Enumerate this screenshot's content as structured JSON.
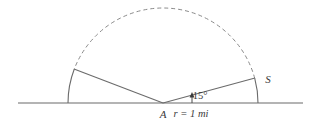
{
  "figure": {
    "type": "geometry-diagram",
    "background_color": "#ffffff",
    "stroke_color": "#6b6b6b",
    "label_color": "#3a3a3a",
    "baseline": {
      "name": "ground-line",
      "x_start": 18,
      "x_end": 303,
      "y": 103
    },
    "center": {
      "label": "A",
      "x": 163,
      "y": 103
    },
    "circle": {
      "radius_px": 95,
      "radius_label": "r = 1 mi",
      "radius_value": 1,
      "radius_unit": "mi"
    },
    "arcs": [
      {
        "name": "dashed-upper-arc",
        "style": "dashed",
        "start_angle_deg": 15,
        "end_angle_deg": 159
      },
      {
        "name": "solid-left-arc",
        "style": "solid",
        "start_angle_deg": 159,
        "end_angle_deg": 180
      },
      {
        "name": "solid-right-arc",
        "style": "solid",
        "start_angle_deg": 0,
        "end_angle_deg": 15
      }
    ],
    "rays": [
      {
        "name": "left-ray",
        "from_x": 163,
        "from_y": 103,
        "to_x": 74,
        "to_y": 69,
        "angle_deg": 159
      },
      {
        "name": "right-ray",
        "from_x": 163,
        "from_y": 103,
        "to_x": 255,
        "to_y": 78,
        "angle_deg": 15
      }
    ],
    "angle_marker": {
      "name": "angle-arrow",
      "x": 192,
      "y_base": 103,
      "y_tip": 95
    },
    "labels": {
      "center_point": "A",
      "sector_point": "S",
      "angle": "15°",
      "radius": "r = 1 mi"
    },
    "label_positions": {
      "center_point": {
        "x": 163,
        "y": 118
      },
      "sector_point": {
        "x": 268,
        "y": 83
      },
      "angle": {
        "x": 200,
        "y": 99
      },
      "radius": {
        "x": 191,
        "y": 117
      }
    }
  }
}
